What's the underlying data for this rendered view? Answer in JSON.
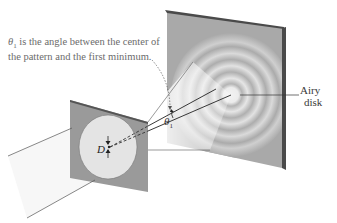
{
  "diagram": {
    "labels": {
      "caption_symbol": "θ",
      "caption_subscript": "1",
      "caption_line1_rest": " is the angle between the center of",
      "caption_line2": "the pattern and the first minimum.",
      "airy_line1": "Airy",
      "airy_line2": "disk",
      "theta_symbol": "θ",
      "theta_subscript": "1",
      "aperture_diameter": "D"
    },
    "elements": {
      "incoming_beam": "light-beam",
      "aperture_plate": "plate-with-circular-hole",
      "screen": "viewing-screen",
      "pattern": "concentric-diffraction-rings",
      "central_disk": "airy-disk"
    },
    "colors": {
      "screen_face": "#a9a9a9",
      "screen_edge": "#4a4a4a",
      "plate_face": "#9a9a9a",
      "hole_fill": "#e4e4e4",
      "beam_fill": "#f6f6f6",
      "ring_light": "#e8e8e8",
      "line": "#333333",
      "caption_text": "#6b6b6b"
    }
  }
}
